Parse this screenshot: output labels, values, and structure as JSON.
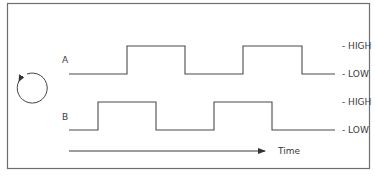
{
  "diagram": {
    "signals": [
      {
        "name": "A",
        "high_label": "- HIGH",
        "low_label": "- LOW",
        "transitions_x": [
          127,
          185,
          243,
          302
        ],
        "initial_level": "low"
      },
      {
        "name": "B",
        "high_label": "- HIGH",
        "low_label": "- LOW",
        "transitions_x": [
          98,
          156,
          214,
          272
        ],
        "initial_level": "low"
      }
    ],
    "time_axis_label": "Time",
    "rotation_icon": "counterclockwise-rotation-icon",
    "colors": {
      "line": "#4a4a4a",
      "border": "#6e6e6e",
      "text": "#3a3a3a",
      "background": "#ffffff"
    }
  }
}
